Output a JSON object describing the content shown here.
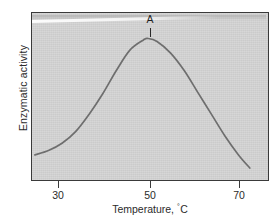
{
  "figure": {
    "background_color": "#ffffff",
    "plot_background_color": "#d2d2d2",
    "frame_color": "#3a3a3a",
    "curve_color": "#6e6e6e"
  },
  "axes": {
    "ylabel": "Enzymatic activity",
    "xlabel_prefix": "Temperature, ",
    "xlabel_degree": "°",
    "xlabel_unit": "C",
    "xlabel_full": "Temperature, °C"
  },
  "ticks": {
    "x": [
      {
        "label": "30",
        "value": 30,
        "px": 58
      },
      {
        "label": "50",
        "value": 50,
        "px": 150
      },
      {
        "label": "70",
        "value": 70,
        "px": 239
      }
    ]
  },
  "annotations": {
    "peak_label": "A",
    "peak_temperature": 50
  },
  "chart_data": {
    "type": "line",
    "title": "",
    "subtitle": "",
    "xlabel": "Temperature, °C",
    "ylabel": "Enzymatic activity",
    "xlim": [
      24,
      74
    ],
    "ylim": [
      0,
      100
    ],
    "grid": false,
    "legend": null,
    "axis_tick_labels": {
      "x": [
        "30",
        "50",
        "70"
      ],
      "y": []
    },
    "annotations": [
      {
        "text": "A",
        "x": 50,
        "y": 100,
        "marker": "vertical-tick",
        "description": "optimum temperature peak marker"
      }
    ],
    "series": [
      {
        "name": "Enzymatic activity",
        "color": "#6e6e6e",
        "x": [
          25,
          28,
          31,
          34,
          37,
          40,
          43,
          46,
          49,
          50,
          52,
          55,
          58,
          61,
          64,
          67,
          70,
          72.5
        ],
        "y": [
          20,
          23,
          28,
          36,
          48,
          62,
          78,
          92,
          99,
          100,
          98,
          90,
          78,
          63,
          48,
          33,
          20,
          11
        ]
      }
    ]
  }
}
